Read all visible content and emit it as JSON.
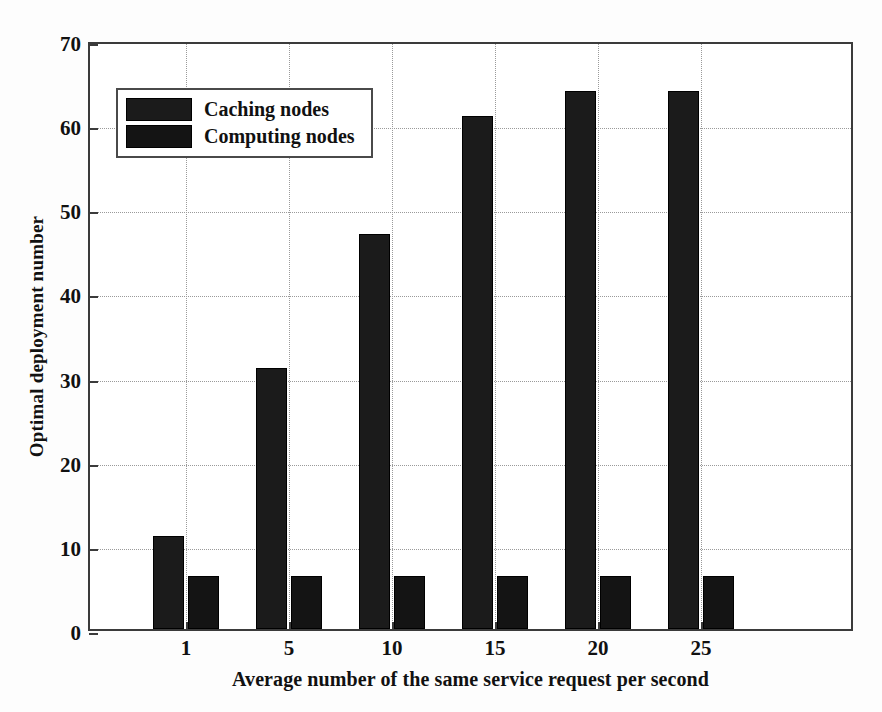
{
  "chart_data": {
    "type": "bar",
    "title": "",
    "xlabel": "Average number of the same service request per second",
    "ylabel": "Optimal deployment number",
    "categories": [
      "1",
      "5",
      "10",
      "15",
      "20",
      "25"
    ],
    "series": [
      {
        "name": "Caching nodes",
        "values": [
          11,
          31,
          47,
          61,
          64,
          64
        ],
        "color": "#1b1b1b"
      },
      {
        "name": "Computing nodes",
        "values": [
          6.3,
          6.3,
          6.3,
          6.3,
          6.3,
          6.3
        ],
        "color": "#141414"
      }
    ],
    "ylim": [
      0,
      70
    ],
    "ytick_labels": [
      "0",
      "10",
      "20",
      "30",
      "40",
      "50",
      "60",
      "70"
    ],
    "ytick_values": [
      0,
      10,
      20,
      30,
      40,
      50,
      60,
      70
    ],
    "xtick_labels": [
      "1",
      "5",
      "10",
      "15",
      "20",
      "25"
    ],
    "grid": "dotted",
    "legend_position": "upper left",
    "legend_entries": [
      "Caching nodes",
      "Computing nodes"
    ]
  },
  "axes": {
    "y_title": "Optimal deployment number",
    "x_title": "Average number of the same service request per second"
  },
  "legend": {
    "rows": [
      {
        "label": "Caching nodes"
      },
      {
        "label": "Computing nodes"
      }
    ]
  }
}
